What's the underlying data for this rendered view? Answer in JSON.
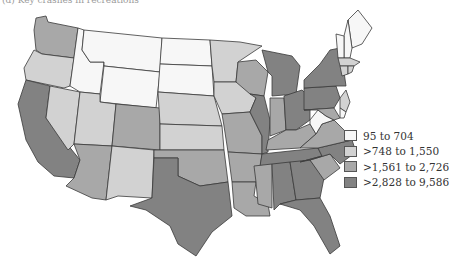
{
  "caption": "(d) Key crashes in recreations",
  "legend": {
    "items": [
      {
        "label": "95 to 704",
        "color": "#f7f7f7"
      },
      {
        "label": ">748 to 1,550",
        "color": "#d2d2d2"
      },
      {
        "label": ">1,561 to 2,726",
        "color": "#a8a8a8"
      },
      {
        "label": ">2,828 to 9,586",
        "color": "#828282"
      }
    ]
  },
  "states": {
    "WA": 2,
    "OR": 1,
    "CA": 3,
    "NV": 1,
    "ID": 0,
    "MT": 0,
    "WY": 0,
    "UT": 1,
    "AZ": 2,
    "CO": 2,
    "NM": 1,
    "ND": 0,
    "SD": 0,
    "NE": 1,
    "KS": 1,
    "OK": 2,
    "TX": 3,
    "MN": 1,
    "IA": 1,
    "MO": 2,
    "AR": 2,
    "LA": 2,
    "WI": 2,
    "IL": 3,
    "MI": 3,
    "IN": 2,
    "OH": 3,
    "KY": 2,
    "TN": 3,
    "MS": 2,
    "AL": 3,
    "GA": 3,
    "FL": 3,
    "SC": 2,
    "NC": 3,
    "VA": 2,
    "WV": 0,
    "PA": 3,
    "NY": 3,
    "ME": 0,
    "NH": 0,
    "VT": 0,
    "MA": 1,
    "CT": 1,
    "RI": 1,
    "NJ": 1,
    "DE": 0,
    "MD": 2
  }
}
